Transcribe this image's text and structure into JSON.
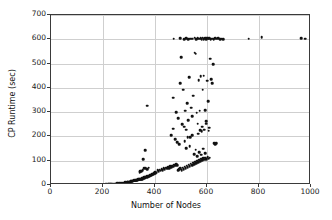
{
  "chart_data": {
    "type": "scatter",
    "title": "",
    "xlabel": "Number of Nodes",
    "ylabel": "CP Runtime (sec)",
    "xlim": [
      0,
      1000
    ],
    "ylim": [
      0,
      700
    ],
    "xticks": [
      0,
      200,
      400,
      600,
      800,
      1000
    ],
    "yticks": [
      0,
      100,
      200,
      300,
      400,
      500,
      600,
      700
    ],
    "grid": true,
    "legend": null,
    "marker": {
      "color": "#111111",
      "shape": "circle",
      "size": 2.6
    },
    "annotations": [
      "Dense low-runtime band rising from ~210 nodes",
      "Timeout ceiling band at 600 sec",
      "Isolated timeout points near 760, 810, 960 and 975 nodes"
    ],
    "series": [
      {
        "name": "CP instances",
        "points": [
          [
            210,
            3
          ],
          [
            214,
            4
          ],
          [
            219,
            3
          ],
          [
            223,
            5
          ],
          [
            228,
            4
          ],
          [
            232,
            6
          ],
          [
            236,
            4
          ],
          [
            241,
            5
          ],
          [
            246,
            6
          ],
          [
            250,
            5
          ],
          [
            255,
            7
          ],
          [
            259,
            6
          ],
          [
            263,
            8
          ],
          [
            268,
            7
          ],
          [
            272,
            9
          ],
          [
            276,
            8
          ],
          [
            280,
            10
          ],
          [
            283,
            9
          ],
          [
            286,
            11
          ],
          [
            289,
            10
          ],
          [
            292,
            12
          ],
          [
            295,
            11
          ],
          [
            297,
            13
          ],
          [
            300,
            12
          ],
          [
            302,
            14
          ],
          [
            305,
            13
          ],
          [
            307,
            15
          ],
          [
            309,
            16
          ],
          [
            311,
            14
          ],
          [
            313,
            17
          ],
          [
            315,
            16
          ],
          [
            317,
            18
          ],
          [
            319,
            17
          ],
          [
            321,
            19
          ],
          [
            323,
            18
          ],
          [
            325,
            20
          ],
          [
            327,
            19
          ],
          [
            329,
            21
          ],
          [
            331,
            20
          ],
          [
            333,
            22
          ],
          [
            335,
            24
          ],
          [
            337,
            21
          ],
          [
            339,
            23
          ],
          [
            341,
            25
          ],
          [
            343,
            22
          ],
          [
            345,
            26
          ],
          [
            347,
            24
          ],
          [
            349,
            27
          ],
          [
            351,
            25
          ],
          [
            353,
            28
          ],
          [
            355,
            30
          ],
          [
            357,
            26
          ],
          [
            359,
            31
          ],
          [
            361,
            29
          ],
          [
            363,
            33
          ],
          [
            365,
            30
          ],
          [
            367,
            35
          ],
          [
            369,
            32
          ],
          [
            371,
            37
          ],
          [
            373,
            34
          ],
          [
            375,
            39
          ],
          [
            377,
            36
          ],
          [
            379,
            41
          ],
          [
            381,
            38
          ],
          [
            383,
            43
          ],
          [
            385,
            40
          ],
          [
            387,
            45
          ],
          [
            389,
            42
          ],
          [
            391,
            47
          ],
          [
            393,
            44
          ],
          [
            395,
            50
          ],
          [
            397,
            46
          ],
          [
            399,
            52
          ],
          [
            401,
            48
          ],
          [
            403,
            55
          ],
          [
            405,
            51
          ],
          [
            352,
            62
          ],
          [
            358,
            70
          ],
          [
            364,
            68
          ],
          [
            370,
            64
          ],
          [
            376,
            72
          ],
          [
            344,
            58
          ],
          [
            362,
            143
          ],
          [
            355,
            106
          ],
          [
            371,
            327
          ],
          [
            341,
            53
          ],
          [
            347,
            56
          ],
          [
            410,
            60
          ],
          [
            414,
            57
          ],
          [
            418,
            63
          ],
          [
            422,
            59
          ],
          [
            426,
            66
          ],
          [
            430,
            61
          ],
          [
            434,
            68
          ],
          [
            438,
            64
          ],
          [
            442,
            71
          ],
          [
            446,
            67
          ],
          [
            450,
            74
          ],
          [
            454,
            70
          ],
          [
            458,
            77
          ],
          [
            462,
            73
          ],
          [
            466,
            80
          ],
          [
            470,
            76
          ],
          [
            474,
            83
          ],
          [
            478,
            79
          ],
          [
            482,
            86
          ],
          [
            486,
            82
          ],
          [
            490,
            60
          ],
          [
            494,
            64
          ],
          [
            498,
            68
          ],
          [
            502,
            62
          ],
          [
            506,
            72
          ],
          [
            510,
            66
          ],
          [
            514,
            76
          ],
          [
            518,
            70
          ],
          [
            522,
            80
          ],
          [
            526,
            74
          ],
          [
            530,
            84
          ],
          [
            534,
            78
          ],
          [
            538,
            88
          ],
          [
            542,
            82
          ],
          [
            546,
            92
          ],
          [
            550,
            86
          ],
          [
            554,
            96
          ],
          [
            558,
            90
          ],
          [
            562,
            100
          ],
          [
            566,
            94
          ],
          [
            570,
            104
          ],
          [
            574,
            98
          ],
          [
            578,
            108
          ],
          [
            582,
            102
          ],
          [
            586,
            110
          ],
          [
            590,
            104
          ],
          [
            594,
            112
          ],
          [
            598,
            106
          ],
          [
            602,
            114
          ],
          [
            606,
            108
          ],
          [
            610,
            112
          ],
          [
            462,
            205
          ],
          [
            470,
            232
          ],
          [
            478,
            188
          ],
          [
            486,
            176
          ],
          [
            494,
            168
          ],
          [
            470,
            360
          ],
          [
            482,
            300
          ],
          [
            490,
            275
          ],
          [
            498,
            420
          ],
          [
            504,
            250
          ],
          [
            500,
            527
          ],
          [
            508,
            392
          ],
          [
            512,
            240
          ],
          [
            516,
            306
          ],
          [
            520,
            228
          ],
          [
            524,
            338
          ],
          [
            528,
            268
          ],
          [
            532,
            444
          ],
          [
            536,
            198
          ],
          [
            540,
            318
          ],
          [
            544,
            284
          ],
          [
            548,
            368
          ],
          [
            552,
            545
          ],
          [
            556,
            540
          ],
          [
            560,
            298
          ],
          [
            564,
            252
          ],
          [
            568,
            432
          ],
          [
            572,
            306
          ],
          [
            576,
            448
          ],
          [
            580,
            222
          ],
          [
            584,
            392
          ],
          [
            588,
            450
          ],
          [
            592,
            308
          ],
          [
            596,
            262
          ],
          [
            600,
            430
          ],
          [
            604,
            345
          ],
          [
            608,
            236
          ],
          [
            612,
            520
          ],
          [
            616,
            436
          ],
          [
            620,
            418
          ],
          [
            624,
            497
          ],
          [
            628,
            172
          ],
          [
            632,
            168
          ],
          [
            636,
            171
          ],
          [
            514,
            180
          ],
          [
            520,
            152
          ],
          [
            526,
            196
          ],
          [
            534,
            160
          ],
          [
            542,
            205
          ],
          [
            550,
            128
          ],
          [
            556,
            145
          ],
          [
            562,
            118
          ],
          [
            570,
            136
          ],
          [
            578,
            124
          ],
          [
            586,
            150
          ],
          [
            594,
            132
          ],
          [
            566,
            212
          ],
          [
            574,
            226
          ],
          [
            582,
            240
          ],
          [
            590,
            228
          ],
          [
            598,
            252
          ],
          [
            606,
            224
          ],
          [
            472,
            603
          ],
          [
            498,
            604
          ],
          [
            512,
            600
          ],
          [
            520,
            605
          ],
          [
            528,
            601
          ],
          [
            536,
            603
          ],
          [
            544,
            602
          ],
          [
            552,
            606
          ],
          [
            558,
            600
          ],
          [
            564,
            604
          ],
          [
            570,
            602
          ],
          [
            576,
            605
          ],
          [
            580,
            600
          ],
          [
            584,
            607
          ],
          [
            588,
            601
          ],
          [
            592,
            604
          ],
          [
            596,
            600
          ],
          [
            600,
            606
          ],
          [
            604,
            602
          ],
          [
            608,
            605
          ],
          [
            614,
            600
          ],
          [
            620,
            603
          ],
          [
            626,
            601
          ],
          [
            632,
            604
          ],
          [
            638,
            602
          ],
          [
            644,
            605
          ],
          [
            650,
            600
          ],
          [
            656,
            603
          ],
          [
            662,
            601
          ],
          [
            760,
            603
          ],
          [
            810,
            608
          ],
          [
            962,
            604
          ],
          [
            978,
            602
          ]
        ]
      }
    ]
  }
}
